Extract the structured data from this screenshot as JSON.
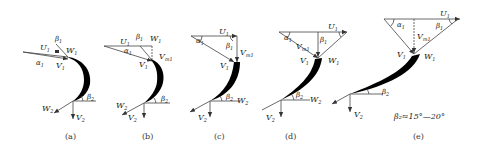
{
  "figure": {
    "panels": [
      {
        "id": "a",
        "caption": "(a)",
        "labels": {
          "U1": "U",
          "U1_sub": "1",
          "W1": "W",
          "W1_sub": "1",
          "V1": "V",
          "V1_sub": "1",
          "alpha1": "α",
          "alpha1_sub": "1",
          "beta1": "β",
          "beta1_sub": "1",
          "W2": "W",
          "W2_sub": "2",
          "V2": "V",
          "V2_sub": "2",
          "beta2": "β",
          "beta2_sub": "2"
        }
      },
      {
        "id": "b",
        "caption": "(b)",
        "labels": {
          "U1": "U",
          "U1_sub": "1",
          "W1": "W",
          "W1_sub": "1",
          "V1": "V",
          "V1_sub": "1",
          "Vm1": "V",
          "Vm1_sub": "m1",
          "alpha1": "α",
          "alpha1_sub": "1",
          "beta1": "β",
          "beta1_sub": "1",
          "W2": "W",
          "W2_sub": "2",
          "V2": "V",
          "V2_sub": "2",
          "beta2": "β",
          "beta2_sub": "2"
        }
      },
      {
        "id": "c",
        "caption": "(c)",
        "labels": {
          "U1": "U",
          "U1_sub": "1",
          "V1": "V",
          "V1_sub": "1",
          "Vm1": "V",
          "Vm1_sub": "m1",
          "alpha1": "α",
          "alpha1_sub": "1",
          "beta1": "β",
          "beta1_sub": "1",
          "W2": "W",
          "W2_sub": "2",
          "V2": "V",
          "V2_sub": "2",
          "beta2": "β",
          "beta2_sub": "2"
        }
      },
      {
        "id": "d",
        "caption": "(d)",
        "labels": {
          "U1": "U",
          "U1_sub": "1",
          "W1": "W",
          "W1_sub": "1",
          "V1": "V",
          "V1_sub": "1",
          "Vm1": "V",
          "Vm1_sub": "m1",
          "alpha1": "α",
          "alpha1_sub": "1",
          "beta1": "β",
          "beta1_sub": "1",
          "W2": "W",
          "W2_sub": "2",
          "V2": "V",
          "V2_sub": "2",
          "beta2": "β",
          "beta2_sub": "2"
        }
      },
      {
        "id": "e",
        "caption": "(e)",
        "labels": {
          "U1": "U",
          "U1_sub": "1",
          "W1": "W",
          "W1_sub": "1",
          "V1": "V",
          "V1_sub": "1",
          "Vm1": "V",
          "Vm1_sub": "m1",
          "alpha1": "α",
          "alpha1_sub": "1",
          "beta1": "β",
          "beta1_sub": "1",
          "V2": "V",
          "V2_sub": "2",
          "beta2": "β",
          "beta2_sub": "2"
        },
        "note": "β₂≈15°—20°"
      }
    ]
  }
}
